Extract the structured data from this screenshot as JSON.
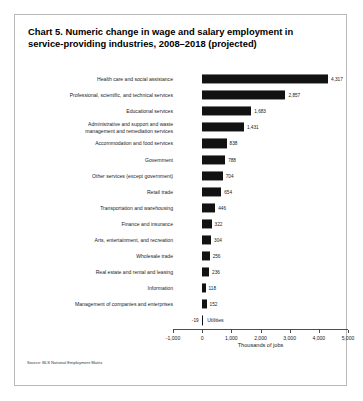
{
  "figure": {
    "title_prefix": "Chart 5.",
    "title": "Numeric change in wage and salary employment in service-providing industries, 2008–2018 (projected)",
    "source": "Source: BLS National Employment Matrix"
  },
  "chart_data": {
    "type": "bar",
    "orientation": "horizontal",
    "title": "Chart 5. Numeric change in wage and salary employment in service-providing industries, 2008–2018 (projected)",
    "xlabel": "Thousands of jobs",
    "ylabel": "",
    "xlim": [
      -1000,
      5000
    ],
    "xticks": [
      -1000,
      0,
      1000,
      2000,
      3000,
      4000,
      5000
    ],
    "xticklabels": [
      "-1,000",
      "0",
      "1,000",
      "2,000",
      "3,000",
      "4,000",
      "5,000"
    ],
    "grid": false,
    "legend": false,
    "bar_color": "#121212",
    "categories": [
      "Health care and social assistance",
      "Professional, scientific, and technical services",
      "Educational services",
      "Administrative and support and waste\nmanagement and remediation services",
      "Accommodation and food services",
      "Government",
      "Other services (except government)",
      "Retail trade",
      "Transportation and warehousing",
      "Finance and insurance",
      "Arts, entertainment, and recreation",
      "Wholesale trade",
      "Real estate and rental and leasing",
      "Information",
      "Management of companies and enterprises",
      "Utilities"
    ],
    "values": [
      4317,
      2857,
      1683,
      1431,
      838,
      788,
      704,
      654,
      446,
      322,
      304,
      256,
      236,
      118,
      152,
      -19
    ],
    "value_labels": [
      "4,317",
      "2,857",
      "1,683",
      "1,431",
      "838",
      "788",
      "704",
      "654",
      "446",
      "322",
      "304",
      "256",
      "236",
      "118",
      "152",
      "-19"
    ]
  }
}
